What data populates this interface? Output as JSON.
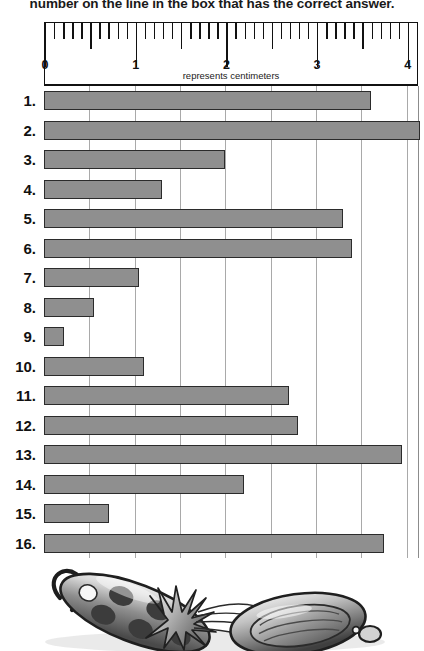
{
  "page": {
    "heading": "number on the line in the box that has the correct answer."
  },
  "ruler": {
    "caption": "represents centimeters",
    "unit": "centimeters",
    "labels": [
      "0",
      "1",
      "2",
      "3",
      "4"
    ],
    "min": 0,
    "max": 4.12,
    "major_step": 1,
    "minor_step": 0.1,
    "half_step": 0.5
  },
  "chart_data": {
    "type": "bar",
    "orientation": "horizontal",
    "title": "",
    "xlabel": "represents centimeters",
    "ylabel": "",
    "xlim": [
      0,
      4.12
    ],
    "grid": true,
    "grid_step": 0.5,
    "units": "cm",
    "categories": [
      "1.",
      "2.",
      "3.",
      "4.",
      "5.",
      "6.",
      "7.",
      "8.",
      "9.",
      "10.",
      "11.",
      "12.",
      "13.",
      "14.",
      "15.",
      "16."
    ],
    "values": [
      3.6,
      4.15,
      2.0,
      1.3,
      3.3,
      3.4,
      1.05,
      0.55,
      0.22,
      1.1,
      2.7,
      2.8,
      3.95,
      2.2,
      0.72,
      3.75
    ],
    "bar_color": "#8f8f8f",
    "bar_border_color": "#2b2b2b",
    "gridline_color": "#a9a9a9"
  },
  "artwork": {
    "caption": "grayscale clip-art illustration of fishing lures"
  }
}
